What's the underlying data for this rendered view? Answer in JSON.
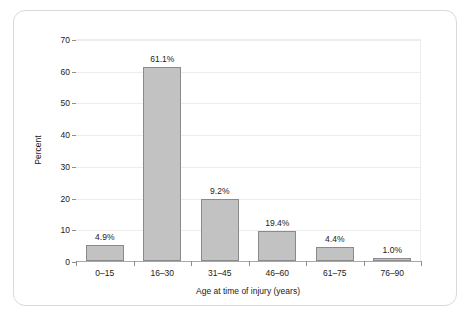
{
  "chart_data": {
    "type": "bar",
    "title": "",
    "xlabel": "Age at time of injury (years)",
    "ylabel": "Percent",
    "categories": [
      "0–15",
      "16–30",
      "31–45",
      "46–60",
      "61–75",
      "76–90"
    ],
    "values": [
      4.9,
      61.1,
      19.6,
      9.4,
      4.4,
      1.0
    ],
    "data_labels": [
      "4.9%",
      "61.1%",
      "9.2%",
      "19.4%",
      "4.4%",
      "1.0%"
    ],
    "ylim": [
      0,
      70
    ],
    "yticks": [
      0,
      10,
      20,
      30,
      40,
      50,
      60,
      70
    ],
    "ytick_labels": [
      "0",
      "10",
      "20",
      "30",
      "40",
      "50",
      "60",
      "70"
    ],
    "grid": "horizontal",
    "legend": "none",
    "bar_color": "#c2c2c2",
    "bar_edge_color": "#8a8a8a",
    "grid_color": "#ededed",
    "axis_color": "#a8a8a8",
    "frame_color": "#d9d9d9",
    "text_color": "#1a1a1a"
  }
}
